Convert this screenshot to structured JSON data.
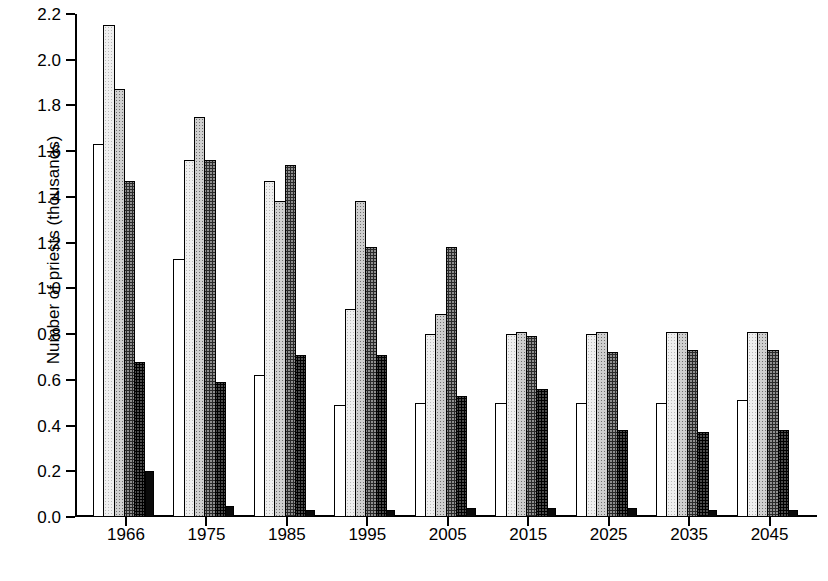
{
  "chart_data": {
    "type": "bar",
    "title": "",
    "xlabel": "",
    "ylabel": "Number of priests (thousands)",
    "categories": [
      "1966",
      "1975",
      "1985",
      "1995",
      "2005",
      "2015",
      "2025",
      "2035",
      "2045"
    ],
    "ylim": [
      0.0,
      2.2
    ],
    "yticks": [
      "0.0",
      "0.2",
      "0.4",
      "0.6",
      "0.8",
      "1.0",
      "1.2",
      "1.4",
      "1.6",
      "1.8",
      "2.0",
      "2.2"
    ],
    "ytick_values": [
      0.0,
      0.2,
      0.4,
      0.6,
      0.8,
      1.0,
      1.2,
      1.4,
      1.6,
      1.8,
      2.0,
      2.2
    ],
    "grid": false,
    "legend": "none",
    "series": [
      {
        "name": "series-1",
        "fill": "white",
        "values": [
          1.63,
          1.13,
          0.62,
          0.49,
          0.5,
          0.5,
          0.5,
          0.5,
          0.51
        ]
      },
      {
        "name": "series-2",
        "fill": "light-gray",
        "values": [
          2.15,
          1.56,
          1.47,
          0.91,
          0.8,
          0.8,
          0.8,
          0.81,
          0.81
        ]
      },
      {
        "name": "series-3",
        "fill": "medium-gray",
        "values": [
          1.87,
          1.75,
          1.38,
          1.38,
          0.89,
          0.81,
          0.81,
          0.81,
          0.81
        ]
      },
      {
        "name": "series-4",
        "fill": "dark-gray",
        "values": [
          1.47,
          1.56,
          1.54,
          1.18,
          1.18,
          0.79,
          0.72,
          0.73,
          0.73
        ]
      },
      {
        "name": "series-5",
        "fill": "black-solid",
        "values": [
          0.68,
          0.59,
          0.71,
          0.71,
          0.53,
          0.56,
          0.38,
          0.37,
          0.38
        ]
      },
      {
        "name": "series-6",
        "fill": "black-solid",
        "values": [
          0.2,
          0.05,
          0.03,
          0.03,
          0.04,
          0.04,
          0.04,
          0.03,
          0.03
        ]
      }
    ]
  },
  "colors": {
    "axis": "#000000",
    "background": "#ffffff",
    "series_fills": [
      "#ffffff",
      "#efefef",
      "#cfcfcf",
      "#8f8f8f",
      "#4a4a4a",
      "#0a0a0a"
    ]
  }
}
